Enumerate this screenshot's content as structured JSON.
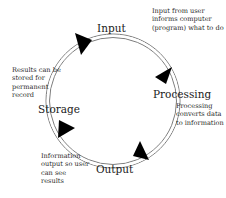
{
  "diagram": {
    "type": "cycle",
    "colors": {
      "ring": "#8a8a8a",
      "arrow": "#000000",
      "text": "#1a1a1a"
    },
    "stages": [
      {
        "name": "Input",
        "description": "Input from user informs computer (program) what to do"
      },
      {
        "name": "Processing",
        "description": "Processing converts data to information"
      },
      {
        "name": "Output",
        "description": "Information output so user can see results"
      },
      {
        "name": "Storage",
        "description": "Results can be stored for permanent record"
      }
    ],
    "flow_direction": "clockwise"
  }
}
